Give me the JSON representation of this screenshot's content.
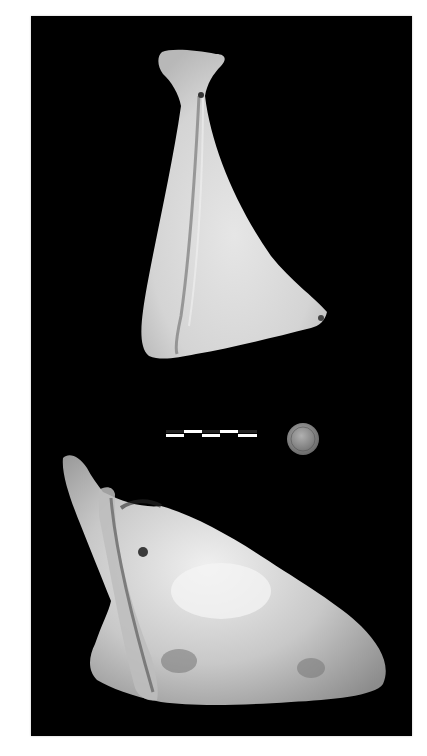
{
  "image": {
    "background_color": "#000000",
    "page_color": "#ffffff",
    "subjects": [
      {
        "name": "scapula-bone-top",
        "view": "lateral",
        "color": "#d8d8d8"
      },
      {
        "name": "scapula-bone-bottom",
        "view": "oblique",
        "color": "#cfcfcf"
      }
    ],
    "scale_bar": {
      "segments": 5,
      "colors": [
        "#ffffff",
        "#222222"
      ]
    },
    "reference_coin": {
      "color": "#9a9a9a"
    }
  }
}
